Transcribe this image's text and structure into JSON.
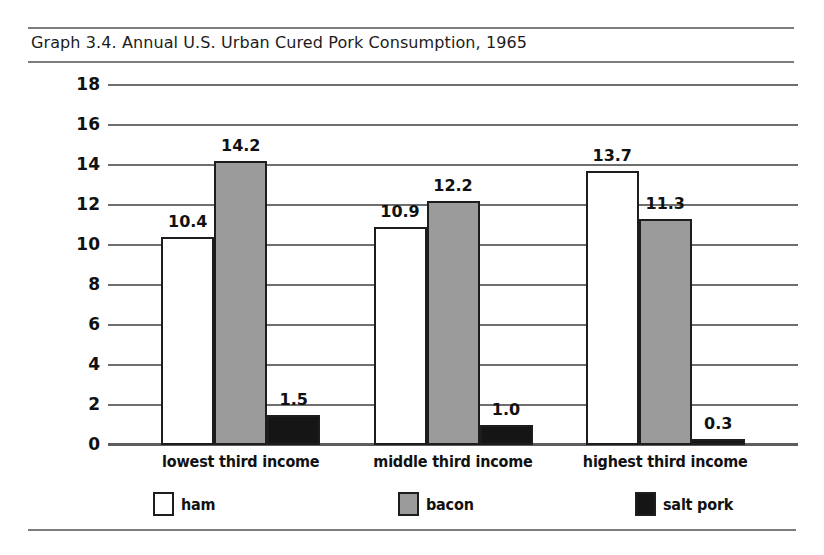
{
  "figure": {
    "title": "Graph 3.4. Annual U.S. Urban Cured Pork Consumption, 1965"
  },
  "chart_data": {
    "type": "bar",
    "title": "Graph 3.4. Annual U.S. Urban Cured Pork Consumption, 1965",
    "xlabel": "",
    "ylabel": "pounds per capita",
    "categories": [
      "lowest third income",
      "middle third income",
      "highest third income"
    ],
    "series": [
      {
        "name": "ham",
        "color": "#ffffff",
        "values": [
          10.4,
          10.9,
          13.7
        ],
        "labels": [
          "10.4",
          "10.9",
          "13.7"
        ]
      },
      {
        "name": "bacon",
        "color": "#9b9b9b",
        "values": [
          14.2,
          12.2,
          11.3
        ],
        "labels": [
          "14.2",
          "12.2",
          "11.3"
        ]
      },
      {
        "name": "salt pork",
        "color": "#151515",
        "values": [
          1.5,
          1.0,
          0.3
        ],
        "labels": [
          "1.5",
          "1.0",
          "0.3"
        ]
      }
    ],
    "ylim": [
      0,
      18
    ],
    "yticks": [
      "0",
      "2",
      "4",
      "6",
      "8",
      "10",
      "12",
      "14",
      "16",
      "18"
    ],
    "grid": true,
    "legend_position": "bottom",
    "legend": [
      "ham",
      "bacon",
      "salt pork"
    ]
  }
}
